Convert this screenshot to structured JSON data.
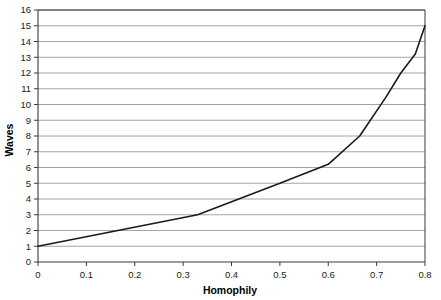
{
  "chart_data": {
    "type": "line",
    "title": "",
    "xlabel": "Homophily",
    "ylabel": "Waves",
    "xlim": [
      0,
      0.8
    ],
    "ylim": [
      0,
      16
    ],
    "xticks": [
      "0",
      "0.1",
      "0.2",
      "0.3",
      "0.4",
      "0.5",
      "0.6",
      "0.7",
      "0.8"
    ],
    "xtick_values": [
      0,
      0.1,
      0.2,
      0.3,
      0.4,
      0.5,
      0.6,
      0.7,
      0.8
    ],
    "yticks": [
      "0",
      "1",
      "2",
      "3",
      "4",
      "5",
      "6",
      "7",
      "8",
      "9",
      "10",
      "11",
      "12",
      "13",
      "14",
      "15",
      "16"
    ],
    "ytick_values": [
      0,
      1,
      2,
      3,
      4,
      5,
      6,
      7,
      8,
      9,
      10,
      11,
      12,
      13,
      14,
      15,
      16
    ],
    "grid": "horizontal",
    "legend": "none",
    "series": [
      {
        "name": "Waves vs Homophily",
        "color": "#1a1a1a",
        "x": [
          0,
          0.33,
          0.5,
          0.6,
          0.665,
          0.72,
          0.75,
          0.78,
          0.8
        ],
        "y": [
          1,
          3,
          5,
          6.2,
          8,
          10.5,
          12,
          13.2,
          15
        ]
      }
    ],
    "colors": {
      "line": "#1a1a1a",
      "grid": "#9a9a9a",
      "axis": "#3a3a3a",
      "background": "#ffffff",
      "text": "#1a1a1a"
    }
  }
}
